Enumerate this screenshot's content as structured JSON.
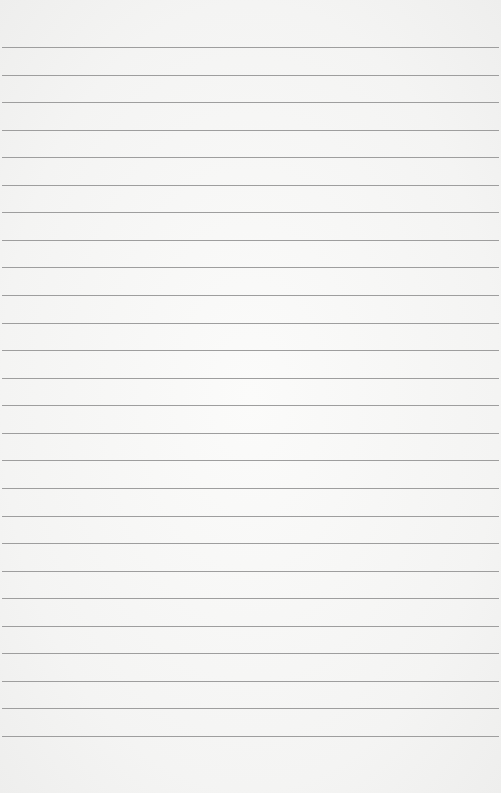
{
  "paper": {
    "type": "lined-paper",
    "background_color": "#f6f6f5",
    "line_color": "#9e9e9e",
    "line_count": 26,
    "first_line_y": 47,
    "line_spacing": 27.56
  }
}
